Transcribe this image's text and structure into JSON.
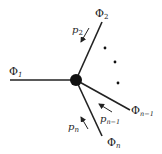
{
  "diagram": {
    "type": "vertex-with-external-legs",
    "vertex": {
      "name": "center-vertex",
      "x": 76,
      "y": 80,
      "r": 6,
      "color": "#111111"
    },
    "legs": [
      {
        "field": "Φ",
        "sub": "1",
        "end": [
          10,
          80
        ]
      },
      {
        "field": "Φ",
        "sub": "2",
        "end": [
          102,
          22
        ]
      },
      {
        "field": "Φ",
        "sub": "n−1",
        "end": [
          130,
          110
        ]
      },
      {
        "field": "Φ",
        "sub": "n",
        "end": [
          102,
          136
        ]
      }
    ],
    "momenta": [
      {
        "label": "p",
        "sub": "2"
      },
      {
        "label": "p",
        "sub": "n−1"
      },
      {
        "label": "p",
        "sub": "n"
      }
    ],
    "ellipsis": "⋮",
    "line_color": "#222222"
  },
  "labels": {
    "phi1": "Φ",
    "phi1_sub": "1",
    "phi2": "Φ",
    "phi2_sub": "2",
    "phin1": "Φ",
    "phin1_sub": "n−1",
    "phin": "Φ",
    "phin_sub": "n",
    "p2": "p",
    "p2_sub": "2",
    "pn1": "p",
    "pn1_sub": "n−1",
    "pn": "p",
    "pn_sub": "n"
  }
}
